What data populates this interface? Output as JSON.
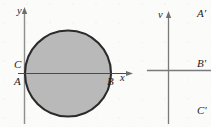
{
  "figure": {
    "background_color": "#fbfbfa",
    "ink_color": "#1d1d1d",
    "fill_color": "#b9b9b9",
    "axis_color": "#8e8e8e"
  },
  "left_panel": {
    "name": "xy-plane",
    "axis_labels": {
      "vertical": "y",
      "horizontal": "x"
    },
    "point_labels": {
      "c": "C",
      "a": "A",
      "b": "B"
    },
    "shape": {
      "kind": "circle",
      "fill": "#b9b9b9",
      "outline": "#2b2b2b",
      "center_x": 68,
      "center_y": 73,
      "radius": 43
    },
    "chord": {
      "kind": "horizontal-axis-through-circle",
      "y": 73
    }
  },
  "right_panel": {
    "name": "uv-plane",
    "axis_labels": {
      "vertical": "v"
    },
    "point_labels": {
      "a_prime": "A'",
      "b_prime": "B'",
      "c_prime": "C'"
    }
  }
}
